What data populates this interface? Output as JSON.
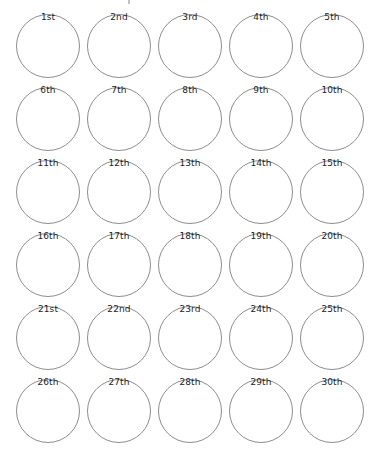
{
  "worksheet": {
    "kind": "blank-circle-grid-worksheet",
    "columns": 5,
    "rows": 6,
    "total_circles": 30,
    "background_color": "#ffffff",
    "circle_stroke_color": "#8d8d92",
    "label_color": "#1d1d1f",
    "circle_diameter_px": 64,
    "column_pitch_px": 71,
    "row_pitch_px": 73
  },
  "cells": [
    {
      "label": "1st"
    },
    {
      "label": "2nd"
    },
    {
      "label": "3rd"
    },
    {
      "label": "4th"
    },
    {
      "label": "5th"
    },
    {
      "label": "6th"
    },
    {
      "label": "7th"
    },
    {
      "label": "8th"
    },
    {
      "label": "9th"
    },
    {
      "label": "10th"
    },
    {
      "label": "11th"
    },
    {
      "label": "12th"
    },
    {
      "label": "13th"
    },
    {
      "label": "14th"
    },
    {
      "label": "15th"
    },
    {
      "label": "16th"
    },
    {
      "label": "17th"
    },
    {
      "label": "18th"
    },
    {
      "label": "19th"
    },
    {
      "label": "20th"
    },
    {
      "label": "21st"
    },
    {
      "label": "22nd"
    },
    {
      "label": "23rd"
    },
    {
      "label": "24th"
    },
    {
      "label": "25th"
    },
    {
      "label": "26th"
    },
    {
      "label": "27th"
    },
    {
      "label": "28th"
    },
    {
      "label": "29th"
    },
    {
      "label": "30th"
    }
  ]
}
